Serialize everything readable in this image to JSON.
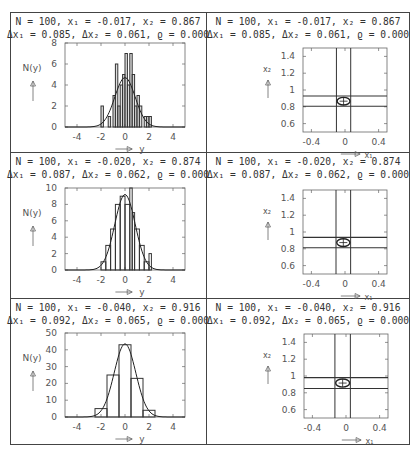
{
  "panels": [
    {
      "row": 0,
      "header": {
        "line1": "N  =   100, x₁ = -0.017, x₂ =   0.867",
        "line2": "Δx₁ =   0.085, Δx₂ =   0.061, ϱ =   0.000"
      }
    },
    {
      "row": 1,
      "header": {
        "line1": "N  =   100, x₁ = -0.020, x₂ =   0.874",
        "line2": "Δx₁ =   0.087, Δx₂ =   0.062, ϱ =   0.000"
      }
    },
    {
      "row": 2,
      "header": {
        "line1": "N  =   100, x₁ = -0.040, x₂ =   0.916",
        "line2": "Δx₁ =   0.092, Δx₂ =   0.065, ϱ =   0.000"
      }
    }
  ],
  "labels": {
    "hist_ylabel": "N(y)",
    "hist_xlabel": "y",
    "scatter_ylabel": "x₂",
    "scatter_xlabel": "x₁"
  },
  "chart_data": [
    {
      "type": "bar",
      "title": "Histogram row 1 (fine binning)",
      "xlabel": "y",
      "ylabel": "N(y)",
      "xlim": [
        -5,
        5
      ],
      "ylim": [
        0,
        8
      ],
      "xticks": [
        -4,
        -2,
        0,
        2,
        4
      ],
      "yticks": [
        0,
        2,
        4,
        6,
        8
      ],
      "bins": [
        {
          "x0": -2.0,
          "x1": -1.8,
          "n": 2
        },
        {
          "x0": -1.4,
          "x1": -1.2,
          "n": 1
        },
        {
          "x0": -1.0,
          "x1": -0.8,
          "n": 3
        },
        {
          "x0": -0.8,
          "x1": -0.6,
          "n": 6
        },
        {
          "x0": -0.6,
          "x1": -0.4,
          "n": 2
        },
        {
          "x0": -0.4,
          "x1": -0.2,
          "n": 4
        },
        {
          "x0": -0.2,
          "x1": 0.0,
          "n": 5
        },
        {
          "x0": 0.0,
          "x1": 0.2,
          "n": 7
        },
        {
          "x0": 0.2,
          "x1": 0.4,
          "n": 4
        },
        {
          "x0": 0.4,
          "x1": 0.6,
          "n": 7
        },
        {
          "x0": 0.6,
          "x1": 0.8,
          "n": 5
        },
        {
          "x0": 0.8,
          "x1": 1.0,
          "n": 2
        },
        {
          "x0": 1.0,
          "x1": 1.2,
          "n": 3
        },
        {
          "x0": 1.2,
          "x1": 1.4,
          "n": 2
        },
        {
          "x0": 1.6,
          "x1": 1.8,
          "n": 1
        },
        {
          "x0": 1.8,
          "x1": 2.0,
          "n": 1
        },
        {
          "x0": 2.0,
          "x1": 2.2,
          "n": 1
        }
      ],
      "curve": {
        "type": "gaussian",
        "mu": 0,
        "sigma": 0.85,
        "peak": 4.7
      }
    },
    {
      "type": "bar",
      "title": "Histogram row 2 (medium binning)",
      "xlabel": "y",
      "ylabel": "N(y)",
      "xlim": [
        -5,
        5
      ],
      "ylim": [
        0,
        10
      ],
      "xticks": [
        -4,
        -2,
        0,
        2,
        4
      ],
      "yticks": [
        0,
        2,
        4,
        6,
        8,
        10
      ],
      "bins": [
        {
          "x0": -2.0,
          "x1": -1.6,
          "n": 1
        },
        {
          "x0": -1.6,
          "x1": -1.2,
          "n": 3
        },
        {
          "x0": -1.2,
          "x1": -0.8,
          "n": 5
        },
        {
          "x0": -0.8,
          "x1": -0.4,
          "n": 8
        },
        {
          "x0": -0.4,
          "x1": 0.0,
          "n": 9
        },
        {
          "x0": 0.0,
          "x1": 0.4,
          "n": 8
        },
        {
          "x0": 0.4,
          "x1": 0.6,
          "n": 10
        },
        {
          "x0": 0.6,
          "x1": 0.8,
          "n": 7
        },
        {
          "x0": 0.8,
          "x1": 1.2,
          "n": 5
        },
        {
          "x0": 1.2,
          "x1": 1.6,
          "n": 3
        },
        {
          "x0": 1.6,
          "x1": 2.0,
          "n": 1
        },
        {
          "x0": 2.0,
          "x1": 2.2,
          "n": 2
        }
      ],
      "curve": {
        "type": "gaussian",
        "mu": 0,
        "sigma": 0.85,
        "peak": 9.2
      }
    },
    {
      "type": "bar",
      "title": "Histogram row 3 (coarse binning)",
      "xlabel": "y",
      "ylabel": "N(y)",
      "xlim": [
        -5,
        5
      ],
      "ylim": [
        0,
        50
      ],
      "xticks": [
        -4,
        -2,
        0,
        2,
        4
      ],
      "yticks": [
        0,
        10,
        20,
        30,
        40,
        50
      ],
      "bins": [
        {
          "x0": -2.5,
          "x1": -1.5,
          "n": 5
        },
        {
          "x0": -1.5,
          "x1": -0.5,
          "n": 25
        },
        {
          "x0": -0.5,
          "x1": 0.5,
          "n": 43
        },
        {
          "x0": 0.5,
          "x1": 1.5,
          "n": 23
        },
        {
          "x0": 1.5,
          "x1": 2.5,
          "n": 4
        }
      ],
      "curve": {
        "type": "gaussian",
        "mu": 0,
        "sigma": 0.9,
        "peak": 43.5
      }
    },
    {
      "type": "scatter",
      "title": "Confidence region row 1",
      "xlabel": "x1",
      "ylabel": "x2",
      "xlim": [
        -0.5,
        0.5
      ],
      "ylim": [
        0.5,
        1.5
      ],
      "xticks": [
        -0.4,
        0,
        0.4
      ],
      "yticks": [
        0.6,
        0.8,
        1,
        1.2,
        1.4
      ],
      "center": [
        -0.017,
        0.867
      ],
      "sigma": [
        0.085,
        0.061
      ],
      "rho": 0.0
    },
    {
      "type": "scatter",
      "title": "Confidence region row 2",
      "xlabel": "x1",
      "ylabel": "x2",
      "xlim": [
        -0.5,
        0.5
      ],
      "ylim": [
        0.5,
        1.5
      ],
      "xticks": [
        -0.4,
        0,
        0.4
      ],
      "yticks": [
        0.6,
        0.8,
        1,
        1.2,
        1.4
      ],
      "center": [
        -0.02,
        0.874
      ],
      "sigma": [
        0.087,
        0.062
      ],
      "rho": 0.0
    },
    {
      "type": "scatter",
      "title": "Confidence region row 3",
      "xlabel": "x1",
      "ylabel": "x2",
      "xlim": [
        -0.5,
        0.5
      ],
      "ylim": [
        0.5,
        1.5
      ],
      "xticks": [
        -0.4,
        0,
        0.4
      ],
      "yticks": [
        0.6,
        0.8,
        1,
        1.2,
        1.4
      ],
      "center": [
        -0.04,
        0.916
      ],
      "sigma": [
        0.092,
        0.065
      ],
      "rho": 0.0
    }
  ]
}
